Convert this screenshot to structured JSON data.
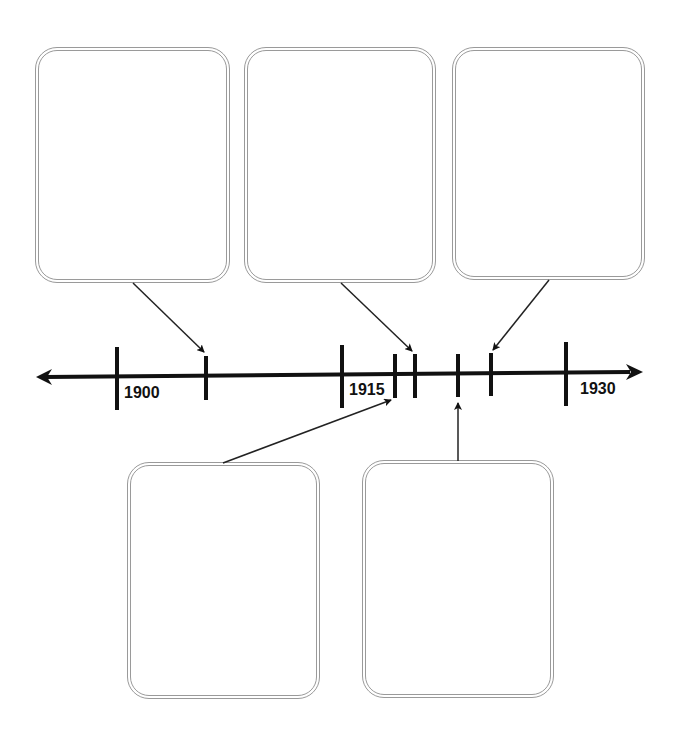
{
  "timeline": {
    "labels": {
      "start": "1900",
      "middle": "1915",
      "end": "1930"
    },
    "colors": {
      "axis": "#111111",
      "box_border": "#9a9a9a",
      "background": "#ffffff"
    },
    "event_boxes": [
      {
        "id": "top-left",
        "text": ""
      },
      {
        "id": "top-middle",
        "text": ""
      },
      {
        "id": "top-right",
        "text": ""
      },
      {
        "id": "bottom-left",
        "text": ""
      },
      {
        "id": "bottom-right",
        "text": ""
      }
    ]
  }
}
